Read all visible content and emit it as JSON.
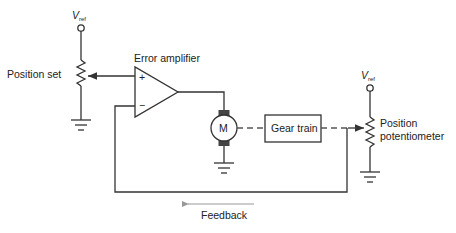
{
  "diagram": {
    "labels": {
      "vref_main": "V",
      "vref_sub": "ref",
      "position_set": "Position set",
      "error_amplifier": "Error amplifier",
      "plus": "+",
      "minus": "−",
      "motor": "M",
      "gear_train": "Gear train",
      "position_pot_line1": "Position",
      "position_pot_line2": "potentiometer",
      "feedback": "Feedback"
    },
    "colors": {
      "wire": "#333333",
      "feedback_arrow": "#999999",
      "brush": "#444444"
    }
  }
}
